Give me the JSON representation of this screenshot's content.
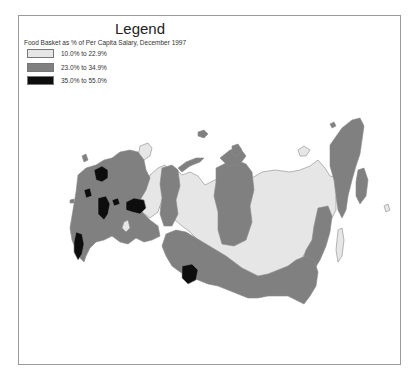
{
  "legend": {
    "title": "Legend",
    "subtitle": "Food Basket as % of Per Capita Salary, December 1997",
    "classes": [
      {
        "label": "10.0% to 22.9%",
        "color": "#e6e6e6"
      },
      {
        "label": "23.0% to 34.9%",
        "color": "#808080"
      },
      {
        "label": "35.0% to 55.0%",
        "color": "#0d0d0d"
      }
    ]
  },
  "map": {
    "subject": "Russia regions choropleth",
    "colors": {
      "low": "#e6e6e6",
      "mid": "#808080",
      "high": "#0d0d0d",
      "border": "#8a8a8a"
    }
  }
}
